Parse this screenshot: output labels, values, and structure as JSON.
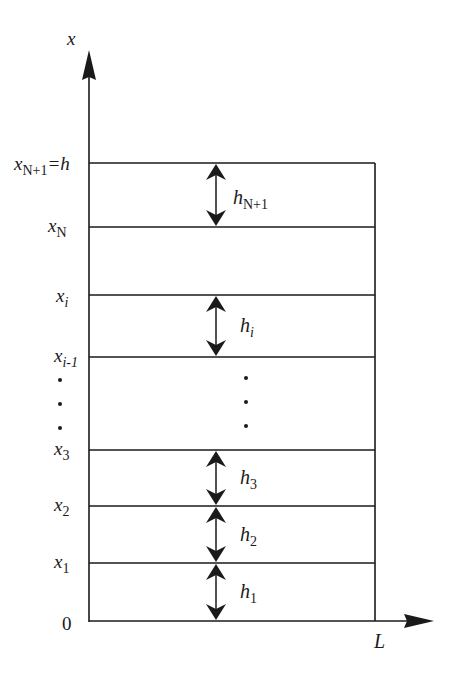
{
  "diagram": {
    "type": "layered-domain",
    "colors": {
      "line": "#1a1a1a",
      "background": "#ffffff"
    },
    "axes": {
      "vertical": {
        "label": "x"
      },
      "horizontal": {
        "label": "L"
      },
      "origin": "0"
    },
    "boundary_labels": [
      {
        "name": "x",
        "sub": "N+1",
        "suffix": "=h"
      },
      {
        "name": "x",
        "sub": "N",
        "suffix": ""
      },
      {
        "name": "x",
        "sub": "i",
        "suffix": ""
      },
      {
        "name": "x",
        "sub": "i-1",
        "suffix": ""
      },
      {
        "name": "x",
        "sub": "3",
        "suffix": ""
      },
      {
        "name": "x",
        "sub": "2",
        "suffix": ""
      },
      {
        "name": "x",
        "sub": "1",
        "suffix": ""
      }
    ],
    "layer_labels": [
      {
        "name": "h",
        "sub": "N+1"
      },
      {
        "name": "h",
        "sub": "i"
      },
      {
        "name": "h",
        "sub": "3"
      },
      {
        "name": "h",
        "sub": "2"
      },
      {
        "name": "h",
        "sub": "1"
      }
    ]
  }
}
